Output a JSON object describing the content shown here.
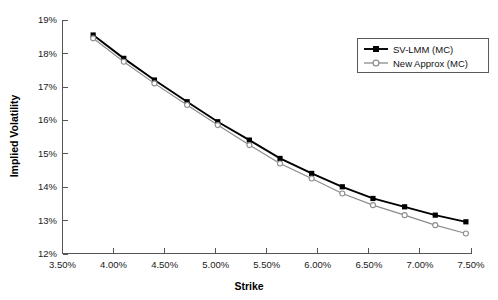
{
  "chart_data": {
    "type": "line",
    "title": "",
    "xlabel": "Strike",
    "ylabel": "Implied Volatility",
    "xlim": [
      3.5,
      7.5
    ],
    "ylim": [
      12,
      19
    ],
    "grid": false,
    "legend_position": "top-right",
    "x_tick_labels": [
      "3.50%",
      "4.00%",
      "4.50%",
      "5.00%",
      "5.50%",
      "6.00%",
      "6.50%",
      "7.00%",
      "7.50%"
    ],
    "x_tick_values": [
      3.5,
      4.0,
      4.5,
      5.0,
      5.5,
      6.0,
      6.5,
      7.0,
      7.5
    ],
    "y_tick_labels": [
      "12%",
      "13%",
      "14%",
      "15%",
      "16%",
      "17%",
      "18%",
      "19%"
    ],
    "y_tick_values": [
      12,
      13,
      14,
      15,
      16,
      17,
      18,
      19
    ],
    "x": [
      3.8,
      4.1,
      4.4,
      4.72,
      5.02,
      5.33,
      5.63,
      5.94,
      6.24,
      6.54,
      6.85,
      7.15,
      7.45
    ],
    "series": [
      {
        "name": "SV-LMM (MC)",
        "color": "#000000",
        "marker": "filled-square",
        "values": [
          18.55,
          17.85,
          17.2,
          16.55,
          15.95,
          15.4,
          14.85,
          14.4,
          14.0,
          13.65,
          13.4,
          13.15,
          12.95
        ]
      },
      {
        "name": "New Approx (MC)",
        "color": "#8c8c8c",
        "marker": "open-circle",
        "values": [
          18.45,
          17.75,
          17.1,
          16.45,
          15.85,
          15.25,
          14.7,
          14.25,
          13.8,
          13.45,
          13.15,
          12.85,
          12.6
        ]
      }
    ]
  },
  "legend": {
    "items": [
      {
        "label": "SV-LMM (MC)"
      },
      {
        "label": "New Approx (MC)"
      }
    ]
  }
}
